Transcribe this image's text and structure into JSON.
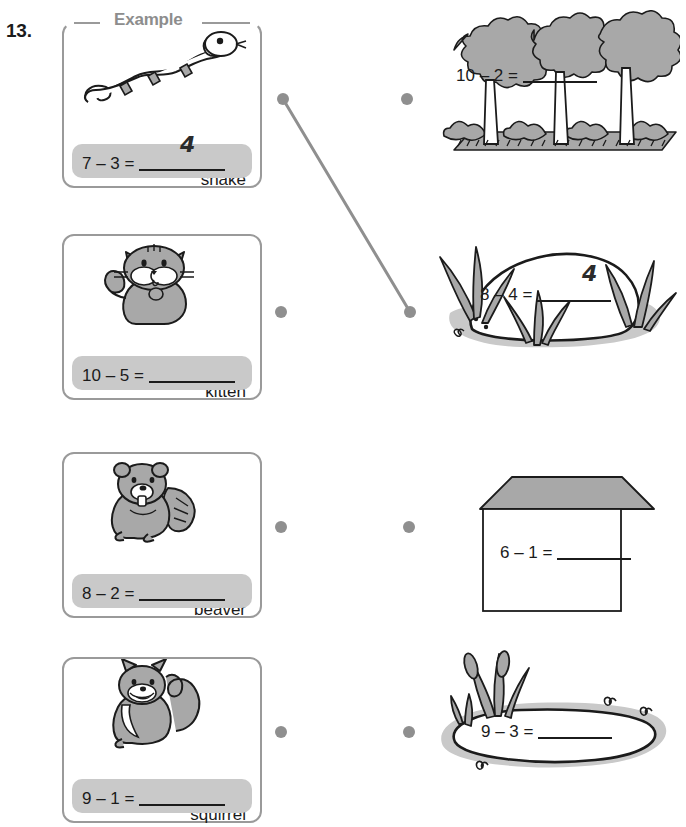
{
  "worksheet": {
    "question_number": "13.",
    "example_label": "Example",
    "colors": {
      "card_border": "#9a9a9a",
      "equation_bar": "#c9c9c9",
      "dot": "#8f8f8f",
      "link_line": "#8f8f8f",
      "art_fill": "#a8a8a8",
      "ink": "#1b1b1b"
    }
  },
  "animal_cards": [
    {
      "label": "snake",
      "icon": "snake-icon",
      "equation": "7 – 3 =",
      "answer": "4",
      "is_example": true
    },
    {
      "label": "kitten",
      "icon": "kitten-icon",
      "equation": "10 – 5 =",
      "answer": "",
      "is_example": false
    },
    {
      "label": "beaver",
      "icon": "beaver-icon",
      "equation": "8 – 2 =",
      "answer": "",
      "is_example": false
    },
    {
      "label": "squirrel",
      "icon": "squirrel-icon",
      "equation": "9 – 1 =",
      "answer": "",
      "is_example": false
    }
  ],
  "habitat_scenes": [
    {
      "name": "forest",
      "icon": "forest-trees-icon",
      "equation": "10 – 2 =",
      "answer": ""
    },
    {
      "name": "lodge",
      "icon": "beaver-lodge-icon",
      "equation": "8 – 4 =",
      "answer": "4"
    },
    {
      "name": "house",
      "icon": "house-icon",
      "equation": "6 – 1 =",
      "answer": ""
    },
    {
      "name": "pond",
      "icon": "pond-icon",
      "equation": "9 – 3 =",
      "answer": ""
    }
  ],
  "connections": [
    {
      "from": "snake",
      "to": "lodge"
    }
  ]
}
